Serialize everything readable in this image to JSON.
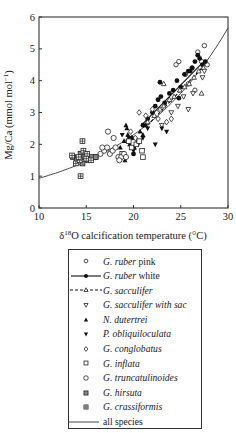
{
  "chart_data": {
    "type": "scatter",
    "title": "",
    "xlabel": "δ18O calcification temperature (°C)",
    "ylabel": "Mg/Ca (mmol mol−1)",
    "xlim": [
      10,
      30
    ],
    "ylim": [
      0,
      6
    ],
    "xticks": [
      10,
      15,
      20,
      25,
      30
    ],
    "yticks": [
      0,
      1,
      2,
      3,
      4,
      5,
      6
    ],
    "grid": false,
    "legend_position": "below",
    "series": [
      {
        "name": "G. ruber pink",
        "italic": "G. ruber",
        "suffix": " pink",
        "marker": "open-circle-small",
        "line": "none",
        "x": [
          24.5,
          24.8,
          25.5,
          26.2,
          26.8,
          27.5,
          27.8,
          26.5,
          25.8,
          27.2
        ],
        "y": [
          4.5,
          4.6,
          4.2,
          4.4,
          4.9,
          5.1,
          4.5,
          3.7,
          3.9,
          4.6
        ]
      },
      {
        "name": "G. ruber white",
        "italic": "G. ruber",
        "suffix": " white",
        "marker": "filled-circle",
        "line": "solid",
        "x": [
          21.0,
          21.5,
          22.0,
          22.3,
          22.6,
          22.9,
          23.3,
          23.8,
          24.2,
          24.6,
          25.0,
          25.4,
          25.8,
          26.2,
          26.5,
          26.8,
          27.0,
          27.3,
          27.6,
          20.0,
          19.8,
          22.8,
          24.8,
          26.0
        ],
        "y": [
          2.6,
          2.8,
          3.0,
          3.2,
          3.4,
          3.5,
          3.3,
          3.6,
          3.7,
          4.0,
          3.8,
          4.2,
          4.3,
          4.4,
          4.6,
          4.8,
          4.7,
          4.5,
          4.6,
          1.7,
          2.2,
          3.95,
          3.45,
          4.3
        ]
      },
      {
        "name": "G. sacculifer",
        "italic": "G. sacculifer",
        "suffix": "",
        "marker": "open-triangle-small",
        "line": "dashed",
        "x": [
          21.5,
          22.2,
          22.8,
          23.2,
          23.8,
          24.3,
          24.9,
          25.4,
          25.9,
          26.4,
          26.9,
          27.4,
          23.2,
          27.2
        ],
        "y": [
          2.7,
          2.9,
          3.1,
          3.2,
          3.4,
          3.5,
          3.7,
          3.8,
          3.9,
          4.1,
          4.3,
          4.4,
          3.9,
          3.6
        ]
      },
      {
        "name": "G. sacculifer with sac",
        "italic": "G. sacculifer with sac",
        "suffix": "",
        "marker": "open-triangle-down",
        "line": "none",
        "x": [
          24.7,
          25.3,
          25.8,
          26.3,
          27.3,
          27.5,
          24.0,
          23.0
        ],
        "y": [
          3.2,
          3.5,
          3.1,
          3.6,
          4.1,
          4.3,
          3.0,
          2.6
        ]
      },
      {
        "name": "N. dutertrei",
        "italic": "N. dutertrei",
        "suffix": "",
        "marker": "filled-triangle",
        "line": "none",
        "x": [
          18.6,
          19.0,
          19.2,
          19.4,
          19.6,
          19.8,
          20.1,
          20.4,
          20.7,
          21.0,
          21.3,
          19.3,
          19.1
        ],
        "y": [
          1.9,
          2.1,
          2.6,
          2.3,
          2.0,
          2.2,
          1.9,
          2.1,
          2.4,
          2.3,
          2.6,
          2.5,
          1.5
        ]
      },
      {
        "name": "P. obliquiloculata",
        "italic": "P. obliquiloculata",
        "suffix": "",
        "marker": "filled-triangle-down",
        "line": "none",
        "x": [
          18.8,
          19.5,
          20.0,
          20.5,
          21.0,
          21.5,
          22.3,
          23.0,
          23.5
        ],
        "y": [
          2.3,
          2.2,
          1.8,
          2.0,
          2.2,
          2.5,
          2.0,
          2.5,
          2.4
        ]
      },
      {
        "name": "G. conglobatus",
        "italic": "G. conglobatus",
        "suffix": "",
        "marker": "open-diamond",
        "line": "none",
        "x": [
          20.6,
          21.3,
          22.0,
          22.6,
          23.5,
          24.0,
          20.2,
          19.7
        ],
        "y": [
          3.0,
          2.9,
          3.1,
          2.8,
          2.7,
          2.8,
          2.2,
          2.4
        ]
      },
      {
        "name": "G. inflata",
        "italic": "G. inflata",
        "suffix": "",
        "marker": "open-square",
        "line": "none",
        "x": [
          19.8,
          20.3,
          20.6,
          20.9,
          21.0,
          19.5,
          18.8
        ],
        "y": [
          1.9,
          2.0,
          2.1,
          1.8,
          1.6,
          2.1,
          1.7
        ]
      },
      {
        "name": "G. truncatulinoides",
        "italic": "G. truncatulinoides",
        "suffix": "",
        "marker": "open-circle",
        "line": "none",
        "x": [
          16.0,
          16.5,
          16.9,
          17.2,
          17.5,
          17.8,
          18.1,
          18.4,
          18.7,
          19.0,
          17.3,
          17.9,
          16.7,
          18.5,
          19.2
        ],
        "y": [
          1.6,
          1.7,
          1.8,
          1.9,
          1.7,
          1.8,
          1.9,
          1.6,
          1.6,
          1.7,
          2.4,
          2.2,
          1.9,
          1.5,
          1.6
        ]
      },
      {
        "name": "G. hirsuta",
        "italic": "G. hirsuta",
        "suffix": "",
        "marker": "filled-square-grey",
        "line": "none",
        "x": [
          13.6,
          14.0,
          14.4,
          14.8,
          15.2,
          15.6,
          16.0,
          14.6
        ],
        "y": [
          1.6,
          1.5,
          1.7,
          1.6,
          1.5,
          1.6,
          1.6,
          1.4
        ]
      },
      {
        "name": "G. crassiformis",
        "italic": "G. crassiformis",
        "suffix": "",
        "marker": "crossed-square",
        "line": "none",
        "x": [
          13.5,
          13.9,
          14.3,
          14.7,
          15.1,
          15.5,
          14.6,
          14.4,
          15.0,
          14.2
        ],
        "y": [
          1.65,
          1.4,
          1.5,
          1.8,
          1.7,
          1.5,
          2.1,
          1.0,
          1.55,
          1.6
        ]
      },
      {
        "name": "all species",
        "italic": "",
        "suffix": "all species",
        "marker": "none",
        "line": "solid-thin",
        "fit": "Mg/Ca = 0.38 exp(0.09 T)",
        "x": [
          10,
          12,
          14,
          16,
          18,
          20,
          22,
          24,
          26,
          28,
          30
        ],
        "y": [
          0.94,
          1.12,
          1.34,
          1.6,
          1.92,
          2.3,
          2.75,
          3.29,
          3.93,
          4.7,
          5.62
        ]
      }
    ]
  }
}
